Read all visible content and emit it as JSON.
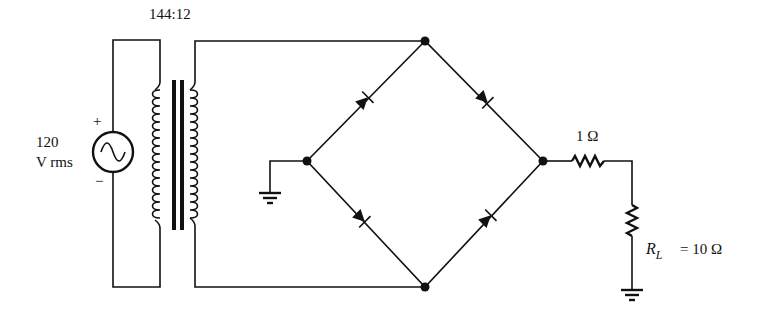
{
  "transformer": {
    "ratio_label": "144:12"
  },
  "source": {
    "value_line1": "120",
    "value_line2": "V rms",
    "plus": "+",
    "minus": "−",
    "icon": "ac-source-icon"
  },
  "series_resistor": {
    "label": "1 Ω"
  },
  "load_resistor": {
    "symbol": "R",
    "subscript": "L",
    "value_label": "= 10 Ω"
  },
  "colors": {
    "ink": "#111111",
    "background": "#ffffff"
  }
}
